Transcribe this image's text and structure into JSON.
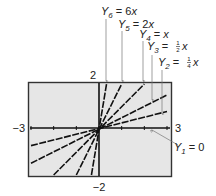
{
  "chart_data": {
    "type": "line",
    "title": "",
    "xlabel": "",
    "ylabel": "",
    "xlim": [
      -3,
      3
    ],
    "ylim": [
      -2,
      2
    ],
    "xticks": [
      -3,
      -2,
      -1,
      0,
      1,
      2,
      3
    ],
    "grid": false,
    "window_labels": {
      "xmin": "−3",
      "xmax": "3",
      "ymin": "−2",
      "ymax": "2"
    },
    "series": [
      {
        "name": "Y1 = 0",
        "slope": 0,
        "label_main": "Y",
        "label_sub": "1",
        "label_rest": " = 0",
        "label_coef": ""
      },
      {
        "name": "Y2 = 1/4 x",
        "slope": 0.25,
        "label_main": "Y",
        "label_sub": "2",
        "label_rest": " = ",
        "label_coef": "1/4",
        "label_var": "x"
      },
      {
        "name": "Y3 = 1/2 x",
        "slope": 0.5,
        "label_main": "Y",
        "label_sub": "3",
        "label_rest": " = ",
        "label_coef": "1/2",
        "label_var": "x"
      },
      {
        "name": "Y4 = x",
        "slope": 1,
        "label_main": "Y",
        "label_sub": "4",
        "label_rest": " = ",
        "label_coef": "",
        "label_var": "x"
      },
      {
        "name": "Y5 = 2x",
        "slope": 2,
        "label_main": "Y",
        "label_sub": "5",
        "label_rest": " = 2",
        "label_coef": "",
        "label_var": "x"
      },
      {
        "name": "Y6 = 6x",
        "slope": 6,
        "label_main": "Y",
        "label_sub": "6",
        "label_rest": " = 6",
        "label_coef": "",
        "label_var": "x"
      }
    ],
    "colors": {
      "screen_bg": "#e6e6e6",
      "line": "#111111",
      "leader": "#777777"
    }
  }
}
